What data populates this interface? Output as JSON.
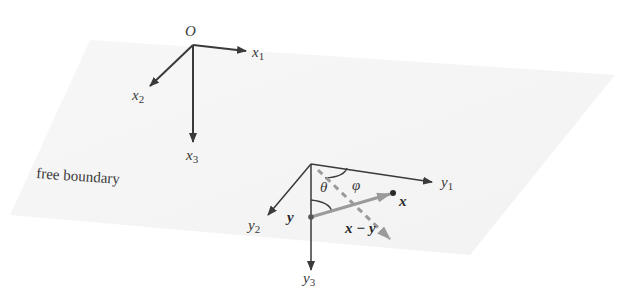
{
  "diagram": {
    "type": "coordinate-systems-on-free-boundary",
    "plane_label": "free boundary",
    "global_frame": {
      "origin_label": "O",
      "axes": [
        {
          "name": "x",
          "sub": "1"
        },
        {
          "name": "x",
          "sub": "2"
        },
        {
          "name": "x",
          "sub": "3"
        }
      ]
    },
    "local_frame": {
      "axes": [
        {
          "name": "y",
          "sub": "1"
        },
        {
          "name": "y",
          "sub": "2"
        },
        {
          "name": "y",
          "sub": "3"
        }
      ]
    },
    "points": {
      "source_point": "y",
      "field_point": "x"
    },
    "vector_label": "x − y",
    "angles": {
      "polar": "θ",
      "azimuth": "φ"
    },
    "colors": {
      "axis": "#3a3a3a",
      "vector": "#9a9a9a",
      "plane": "#f3f3f3"
    }
  }
}
